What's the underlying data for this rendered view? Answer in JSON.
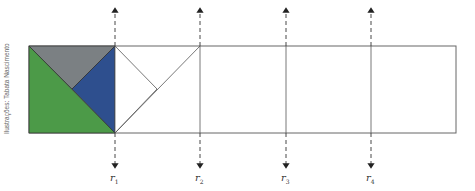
{
  "credit": "Ilustrações: Tabata Nascimento",
  "strip": {
    "left": 29,
    "top": 46,
    "right": 456,
    "bottom": 133
  },
  "lines": [
    {
      "id": "r1",
      "label": "r",
      "sub": "1",
      "x": 115
    },
    {
      "id": "r2",
      "label": "r",
      "sub": "2",
      "x": 200
    },
    {
      "id": "r3",
      "label": "r",
      "sub": "3",
      "x": 286
    },
    {
      "id": "r4",
      "label": "r",
      "sub": "4",
      "x": 371
    }
  ],
  "colors": {
    "green": "#4c9a48",
    "gray": "#7b8083",
    "blue": "#2e4f8e",
    "line": "#555555"
  },
  "shapes": [
    {
      "name": "green-triangle",
      "color": "green"
    },
    {
      "name": "gray-triangle",
      "color": "gray"
    },
    {
      "name": "blue-triangle",
      "color": "blue"
    },
    {
      "name": "white-reflected-triangle",
      "color": "white"
    }
  ]
}
